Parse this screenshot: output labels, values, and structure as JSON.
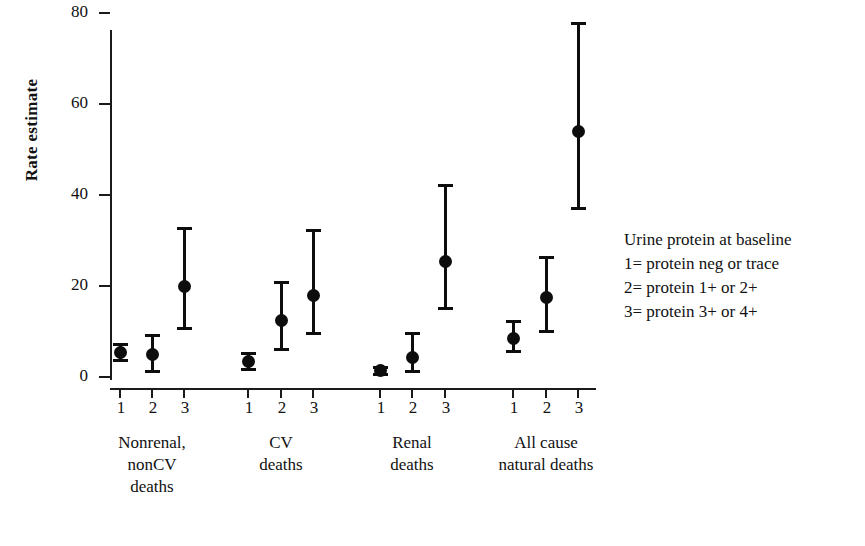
{
  "chart_data": {
    "type": "scatter",
    "title": "",
    "xlabel": "",
    "ylabel": "Rate estimate",
    "ylim": [
      0,
      85
    ],
    "yticks": [
      0,
      20,
      40,
      60,
      80
    ],
    "ytick_labels": [
      "0",
      "20",
      "40",
      "60",
      "80"
    ],
    "grid": false,
    "legend_position": "right",
    "error_bars": "vertical 95% interval with caps",
    "xtick_labels": [
      "1",
      "2",
      "3",
      "1",
      "2",
      "3",
      "1",
      "2",
      "3",
      "1",
      "2",
      "3"
    ],
    "groups": [
      {
        "name": "Nonrenal, nonCV deaths",
        "label_lines": [
          "Nonrenal,",
          "nonCV",
          "deaths"
        ],
        "points": [
          {
            "x_label": "1",
            "value": 5.5,
            "low": 3.5,
            "high": 7.5
          },
          {
            "x_label": "2",
            "value": 5.0,
            "low": 1.0,
            "high": 9.5
          },
          {
            "x_label": "3",
            "value": 20.0,
            "low": 10.5,
            "high": 33.0
          }
        ]
      },
      {
        "name": "CV deaths",
        "label_lines": [
          "CV",
          "deaths"
        ],
        "points": [
          {
            "x_label": "1",
            "value": 3.5,
            "low": 1.5,
            "high": 5.5
          },
          {
            "x_label": "2",
            "value": 12.5,
            "low": 6.0,
            "high": 21.0
          },
          {
            "x_label": "3",
            "value": 18.0,
            "low": 9.5,
            "high": 32.5
          }
        ]
      },
      {
        "name": "Renal deaths",
        "label_lines": [
          "Renal",
          "deaths"
        ],
        "points": [
          {
            "x_label": "1",
            "value": 1.5,
            "low": 0.5,
            "high": 2.5
          },
          {
            "x_label": "2",
            "value": 4.5,
            "low": 1.0,
            "high": 10.0
          },
          {
            "x_label": "3",
            "value": 25.5,
            "low": 15.0,
            "high": 42.5
          }
        ]
      },
      {
        "name": "All cause natural deaths",
        "label_lines": [
          "All cause",
          "natural deaths"
        ],
        "points": [
          {
            "x_label": "1",
            "value": 8.5,
            "low": 5.5,
            "high": 12.5
          },
          {
            "x_label": "2",
            "value": 17.5,
            "low": 10.0,
            "high": 26.5
          },
          {
            "x_label": "3",
            "value": 54.0,
            "low": 37.0,
            "high": 78.0
          }
        ]
      }
    ],
    "legend": {
      "title": "Urine protein at baseline",
      "entries": [
        "1= protein neg or trace",
        "2= protein 1+ or  2+",
        "3= protein 3+ or  4+"
      ]
    }
  }
}
